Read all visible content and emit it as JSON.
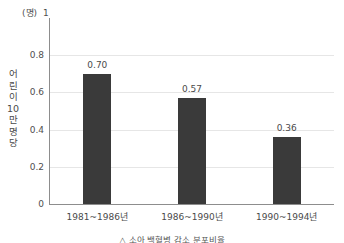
{
  "chart_data": {
    "type": "bar",
    "title": "",
    "subtitle": "",
    "categories": [
      "1981~1986년",
      "1986~1990년",
      "1990~1994년"
    ],
    "values": [
      0.7,
      0.57,
      0.36
    ],
    "value_labels": [
      "0.70",
      "0.57",
      "0.36"
    ],
    "xlabel": "",
    "ylabel": "어린이 10만명당",
    "y_unit": "(명)",
    "ylim": [
      0,
      1
    ],
    "yticks": [
      0,
      0.2,
      0.4,
      0.6,
      0.8,
      1
    ],
    "ytick_labels": [
      "0",
      "0.2",
      "0.4",
      "0.6",
      "0.8",
      "1"
    ],
    "grid": "horizontal",
    "legend": "none",
    "series": [
      {
        "name": "",
        "color": "#3a3a3a",
        "values": [
          0.7,
          0.57,
          0.36
        ]
      }
    ],
    "colors": {
      "bar": "#3a3a3a",
      "axis": "#8d8d8d",
      "grid": "#e6e6e6",
      "text": "#4a4a4a",
      "background": "#ffffff"
    },
    "caption": "△ 소아 백혈병 감소 분포비율"
  }
}
